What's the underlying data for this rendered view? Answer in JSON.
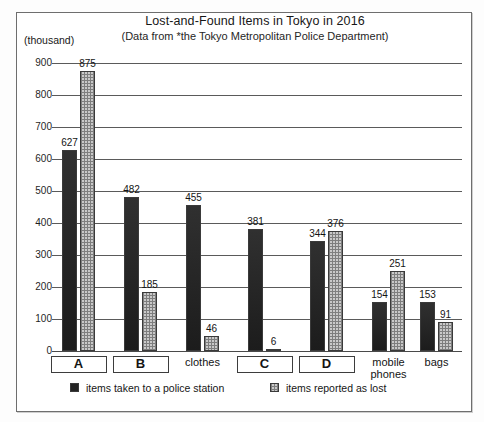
{
  "frame": {
    "border_color": "#6e6e6e"
  },
  "unit_label": "(thousand)",
  "legend": {
    "series1": "items taken to a police station",
    "series2": "items reported as lost",
    "swatch1_icon": "dark-square-icon",
    "swatch2_icon": "dotted-square-icon"
  },
  "chart_data": {
    "type": "bar",
    "title": "Lost-and-Found Items in Tokyo in 2016",
    "subtitle": "(Data from *the Tokyo Metropolitan Police Department)",
    "xlabel": "",
    "ylabel": "(thousand)",
    "ylim": [
      0,
      900
    ],
    "ytick_labels": [
      "900",
      "800",
      "700",
      "600",
      "500",
      "400",
      "300",
      "200",
      "100",
      "0"
    ],
    "yticks": [
      900,
      800,
      700,
      600,
      500,
      400,
      300,
      200,
      100,
      0
    ],
    "grid": true,
    "legend_position": "bottom",
    "categories": [
      "A",
      "B",
      "clothes",
      "C",
      "D",
      "mobile phones",
      "bags"
    ],
    "category_boxed": [
      true,
      true,
      false,
      true,
      true,
      false,
      false
    ],
    "series": [
      {
        "name": "items taken to a police station",
        "color": "#2b2b2b",
        "values": [
          627,
          482,
          455,
          381,
          344,
          154,
          153
        ]
      },
      {
        "name": "items reported as lost",
        "color": "#c9c9c9",
        "values": [
          875,
          185,
          46,
          6,
          376,
          251,
          91
        ]
      }
    ]
  }
}
